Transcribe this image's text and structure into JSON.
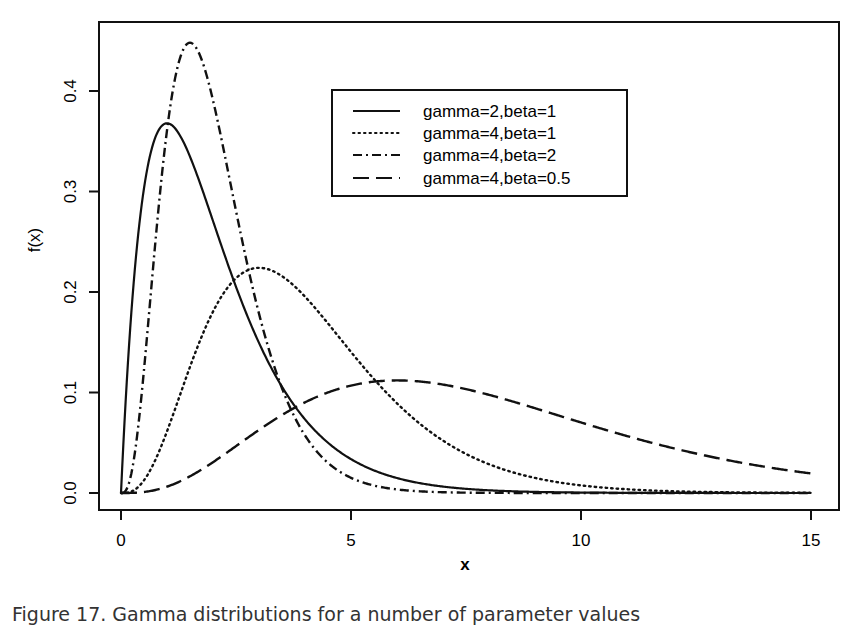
{
  "chart_data": {
    "type": "line",
    "title": "",
    "xlabel": "x",
    "ylabel": "f(x)",
    "xlim": [
      0,
      15
    ],
    "ylim": [
      0,
      0.45
    ],
    "xticks": [
      0,
      5,
      10,
      15
    ],
    "xtick_labels": [
      "0",
      "5",
      "10",
      "15"
    ],
    "yticks": [
      0.0,
      0.1,
      0.2,
      0.3,
      0.4
    ],
    "ytick_labels": [
      "0.0",
      "0.1",
      "0.2",
      "0.3",
      "0.4"
    ],
    "grid": false,
    "legend_position": "upper center",
    "x": [
      0,
      0.5,
      1,
      1.5,
      2,
      2.5,
      3,
      4,
      5,
      6,
      7,
      8,
      9,
      10,
      11,
      12,
      13,
      14,
      15
    ],
    "series": [
      {
        "name": "gamma=2,beta=1",
        "shape": 2,
        "rate": 1,
        "style": "solid",
        "values": [
          0,
          0.303,
          0.368,
          0.335,
          0.271,
          0.205,
          0.149,
          0.073,
          0.034,
          0.015,
          0.006,
          0.003,
          0.001,
          0.0,
          0.0,
          0.0,
          0.0,
          0.0,
          0.0
        ]
      },
      {
        "name": "gamma=4,beta=1",
        "shape": 4,
        "rate": 1,
        "style": "dotted",
        "values": [
          0,
          0.013,
          0.061,
          0.126,
          0.18,
          0.214,
          0.224,
          0.195,
          0.14,
          0.089,
          0.052,
          0.029,
          0.015,
          0.008,
          0.004,
          0.002,
          0.001,
          0.0,
          0.0
        ]
      },
      {
        "name": "gamma=4,beta=2",
        "shape": 4,
        "rate": 2,
        "style": "dashdot",
        "values": [
          0,
          0.368,
          0.361,
          0.448,
          0.391,
          0.175,
          0.089,
          0.015,
          0.002,
          0.0,
          0.0,
          0.0,
          0.0,
          0.0,
          0.0,
          0.0,
          0.0,
          0.0,
          0.0
        ]
      },
      {
        "name": "gamma=4,beta=0.5",
        "shape": 4,
        "rate": 0.5,
        "style": "longdash",
        "values": [
          0,
          0.002,
          0.013,
          0.033,
          0.061,
          0.091,
          0.084,
          0.09,
          0.107,
          0.112,
          0.106,
          0.098,
          0.084,
          0.07,
          0.057,
          0.045,
          0.035,
          0.026,
          0.019
        ]
      }
    ]
  },
  "caption": "Figure 17. Gamma distributions for a number of parameter values"
}
